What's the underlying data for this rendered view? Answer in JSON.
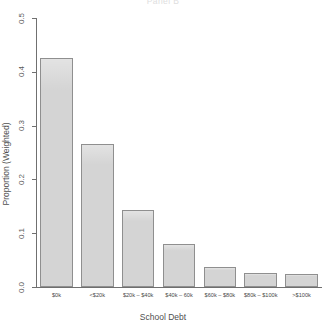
{
  "chart_data": {
    "type": "bar",
    "title": "Panel B",
    "xlabel": "School Debt",
    "ylabel": "Proportion (Weighted)",
    "categories": [
      "$0k",
      "<$20k",
      "$20k – $40k",
      "$40k – 60k",
      "$60k – $80k",
      "$80k – $100k",
      ">$100k"
    ],
    "values": [
      0.425,
      0.265,
      0.143,
      0.08,
      0.038,
      0.026,
      0.025
    ],
    "ylim": [
      0.0,
      0.5
    ],
    "y_ticks": [
      "0.0",
      "0.1",
      "0.2",
      "0.3",
      "0.4",
      "0.5"
    ],
    "y_tick_values": [
      0.0,
      0.1,
      0.2,
      0.3,
      0.4,
      0.5
    ],
    "grid": false,
    "legend": null,
    "bar_fill_color": "#d4d4d4",
    "bar_border_color": "#8f8f8f",
    "axis_color": "#707070",
    "background_color": "#ffffff"
  }
}
